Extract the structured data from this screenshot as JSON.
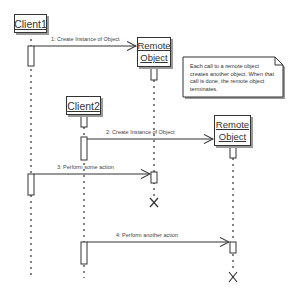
{
  "diagram": {
    "type": "sequence",
    "colors": {
      "line": "#333333",
      "shadow": "#9a9a9a",
      "text": "#444444",
      "background": "#ffffff"
    },
    "participants": [
      {
        "id": "client1",
        "label": "Client1"
      },
      {
        "id": "remote1",
        "label_line1": "Remote",
        "label_line2": "Object"
      },
      {
        "id": "client2",
        "label": "Client2"
      },
      {
        "id": "remote2",
        "label_line1": "Remote",
        "label_line2": "Object"
      }
    ],
    "messages": [
      {
        "label": "1: Create Instance of Object",
        "from": "Client1",
        "to": "Remote Object"
      },
      {
        "label": "2: Create Instance of Object",
        "from": "Client2",
        "to": "Remote Object"
      },
      {
        "label": "3: Perform some action",
        "from": "Client1",
        "to": "Remote Object"
      },
      {
        "label": "4: Perform another action",
        "from": "Client2",
        "to": "Remote Object"
      }
    ],
    "note": {
      "text": "Each call to a remote object creates another object.  When that call is done, the remote object terminates."
    },
    "termination_marks": [
      "X",
      "X"
    ]
  }
}
